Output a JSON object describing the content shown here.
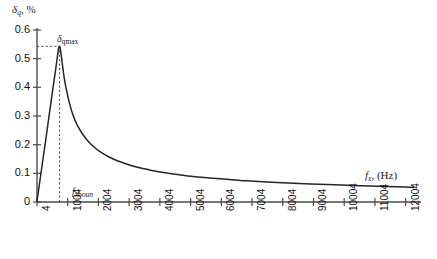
{
  "chart_data": {
    "type": "line",
    "title": "",
    "xlabel": "f_x, (Hz)",
    "ylabel": "δ_q, %",
    "xlim": [
      4,
      12504
    ],
    "ylim": [
      0,
      0.6
    ],
    "grid": false,
    "legend": null,
    "y_ticks": [
      "0",
      "0.1",
      "0.2",
      "0.3",
      "0.4",
      "0.5",
      "0.6"
    ],
    "y_tick_values": [
      0,
      0.1,
      0.2,
      0.3,
      0.4,
      0.5,
      0.6
    ],
    "x_ticks": [
      "4",
      "1004",
      "2004",
      "3004",
      "4004",
      "5004",
      "6004",
      "7004",
      "8004",
      "9004",
      "10004",
      "11004",
      "12004"
    ],
    "x_tick_values": [
      4,
      1004,
      2004,
      3004,
      4004,
      5004,
      6004,
      7004,
      8004,
      9004,
      10004,
      11004,
      12004
    ],
    "series": [
      {
        "name": "quantization-error",
        "color": "#262626",
        "x": [
          4,
          60,
          130,
          210,
          300,
          390,
          470,
          545,
          610,
          665,
          705,
          740,
          775,
          820,
          880,
          960,
          1060,
          1180,
          1320,
          1480,
          1660,
          1860,
          2090,
          2350,
          2640,
          2960,
          3310,
          3700,
          4120,
          4580,
          5080,
          5620,
          6200,
          6820,
          7480,
          8180,
          8920,
          9700,
          10520,
          11380,
          12004,
          12280
        ],
        "y": [
          0.005,
          0.045,
          0.098,
          0.158,
          0.225,
          0.295,
          0.357,
          0.413,
          0.462,
          0.505,
          0.535,
          0.543,
          0.527,
          0.489,
          0.44,
          0.392,
          0.345,
          0.302,
          0.267,
          0.238,
          0.213,
          0.192,
          0.173,
          0.157,
          0.143,
          0.131,
          0.12,
          0.111,
          0.103,
          0.096,
          0.089,
          0.084,
          0.079,
          0.074,
          0.07,
          0.066,
          0.063,
          0.06,
          0.057,
          0.054,
          0.052,
          0.051
        ]
      }
    ],
    "annotations": [
      {
        "name": "delta-q-max",
        "label": "δ_qmax",
        "x": 740,
        "y": 0.543,
        "guide": "dashed-horizontal-to-y-axis"
      },
      {
        "name": "f-x-boun",
        "label": "f_xboun",
        "x": 740,
        "y": 0,
        "guide": "dashed-vertical-from-axis-to-peak"
      }
    ]
  },
  "axes": {
    "y_title_symbol": "δ",
    "y_title_sub": "q",
    "y_title_unit": ", %",
    "x_title_symbol": "f",
    "x_title_sub": "x",
    "x_title_unit": ", (Hz)"
  },
  "annotation_text": {
    "peak_symbol": "δ",
    "peak_sub": "qmax",
    "boundary_symbol": "f",
    "boundary_sub": "xboun"
  },
  "colors": {
    "curve": "#262626",
    "axis": "#4a4a4a",
    "guide": "#3a3a3a",
    "background": "#ffffff",
    "text": "#111111"
  }
}
